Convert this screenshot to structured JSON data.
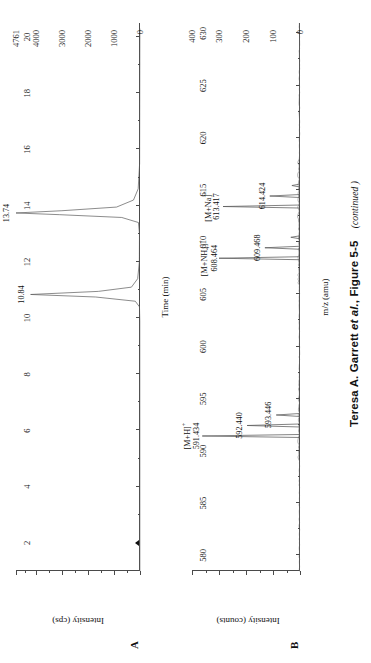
{
  "figure": {
    "caption_main": "Teresa A. Garrett ",
    "caption_etal": "et al.",
    "caption_rest": ", Figure 5-5",
    "caption_continued": "(continued )"
  },
  "panelA": {
    "letter": "A",
    "xlabel": "Time (min)",
    "ylabel": "Intensity (cps)",
    "x_ticks": [
      "2",
      "4",
      "6",
      "8",
      "10",
      "12",
      "14",
      "16",
      "18",
      "20"
    ],
    "y_ticks": [
      "0",
      "1000",
      "2000",
      "3000",
      "4000",
      "4761"
    ],
    "peaks": [
      {
        "label": "10.84",
        "time": 10.84,
        "height": 4200
      },
      {
        "label": "13.74",
        "time": 13.74,
        "height": 4761
      }
    ],
    "marker": {
      "name": "baseline-marker",
      "value": 0
    }
  },
  "panelB": {
    "letter": "B",
    "xlabel": "m/z (amu)",
    "ylabel": "Intensity (counts)",
    "x_ticks": [
      "580",
      "585",
      "590",
      "595",
      "600",
      "605",
      "610",
      "615",
      "620",
      "625",
      "630"
    ],
    "y_ticks": [
      "0",
      "100",
      "200",
      "300",
      "400"
    ],
    "peaks": [
      {
        "ion": "[M+H]",
        "charge": "+",
        "sub": "",
        "label": "591.434",
        "mz": 591.434,
        "height": 362
      },
      {
        "ion": "",
        "charge": "",
        "sub": "",
        "label": "592.440",
        "mz": 592.44,
        "height": 196
      },
      {
        "ion": "",
        "charge": "",
        "sub": "",
        "label": "593.446",
        "mz": 593.446,
        "height": 88
      },
      {
        "ion": "[M+NH",
        "charge": "+",
        "sub": "4",
        "label": "608.464",
        "mz": 608.464,
        "height": 300
      },
      {
        "ion": "",
        "charge": "",
        "sub": "",
        "label": "609.468",
        "mz": 609.468,
        "height": 130
      },
      {
        "ion": "[M+Na]",
        "charge": "+",
        "sub": "",
        "label": "613.417",
        "mz": 613.417,
        "height": 285
      },
      {
        "ion": "",
        "charge": "",
        "sub": "",
        "label": "614.424",
        "mz": 614.424,
        "height": 112
      }
    ]
  },
  "chart_data": [
    {
      "type": "line",
      "panel": "A",
      "title": "",
      "xlabel": "Time (min)",
      "ylabel": "Intensity (cps)",
      "xlim": [
        1,
        20.5
      ],
      "ylim": [
        0,
        4761
      ],
      "xticks": [
        2,
        4,
        6,
        8,
        10,
        12,
        14,
        16,
        18,
        20
      ],
      "yticks": [
        0,
        1000,
        2000,
        3000,
        4000,
        4761
      ],
      "grid": false,
      "legend": "none",
      "annotations": [
        {
          "text": "10.84",
          "x": 10.84,
          "y": 4200
        },
        {
          "text": "13.74",
          "x": 13.74,
          "y": 4761
        }
      ],
      "series": [
        {
          "name": "Total ion chromatogram",
          "x": [
            1.0,
            9.9,
            10.4,
            10.6,
            10.75,
            10.84,
            10.95,
            11.1,
            11.4,
            12.0,
            13.0,
            13.4,
            13.58,
            13.68,
            13.74,
            13.82,
            13.95,
            14.2,
            14.6,
            15.5,
            20.3
          ],
          "y": [
            5,
            8,
            20,
            180,
            1700,
            4200,
            1600,
            330,
            90,
            25,
            20,
            60,
            700,
            3100,
            4761,
            3000,
            900,
            250,
            70,
            15,
            5
          ]
        }
      ]
    },
    {
      "type": "bar",
      "panel": "B",
      "title": "",
      "xlabel": "m/z (amu)",
      "ylabel": "Intensity (counts)",
      "xlim": [
        578.5,
        631
      ],
      "ylim": [
        0,
        400
      ],
      "xticks": [
        580,
        585,
        590,
        595,
        600,
        605,
        610,
        615,
        620,
        625,
        630
      ],
      "yticks": [
        0,
        100,
        200,
        300,
        400
      ],
      "grid": false,
      "legend": "none",
      "x": [
        591.434,
        592.44,
        593.446,
        608.464,
        609.468,
        610.47,
        613.417,
        614.424,
        615.43
      ],
      "values": [
        362,
        196,
        88,
        300,
        130,
        34,
        285,
        112,
        30
      ],
      "annotations": [
        {
          "text": "[M+H]+ 591.434",
          "x": 591.434,
          "y": 362
        },
        {
          "text": "592.440",
          "x": 592.44,
          "y": 196
        },
        {
          "text": "593.446",
          "x": 593.446,
          "y": 88
        },
        {
          "text": "[M+NH4]+ 608.464",
          "x": 608.464,
          "y": 300
        },
        {
          "text": "609.468",
          "x": 609.468,
          "y": 130
        },
        {
          "text": "[M+Na]+ 613.417",
          "x": 613.417,
          "y": 285
        },
        {
          "text": "614.424",
          "x": 614.424,
          "y": 112
        }
      ]
    }
  ]
}
